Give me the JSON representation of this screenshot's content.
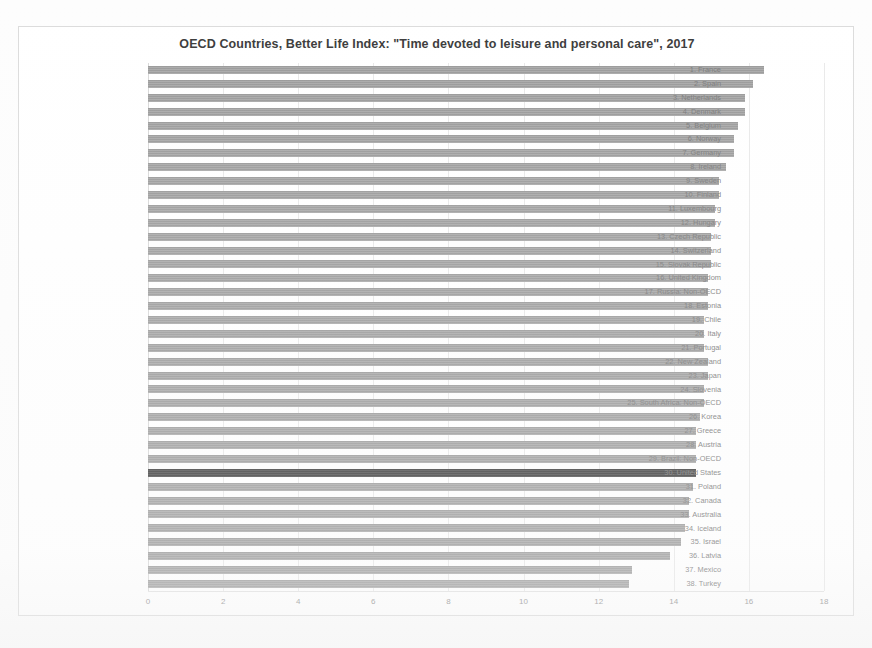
{
  "chart_data": {
    "type": "bar",
    "orientation": "horizontal",
    "title": "OECD Countries, Better Life Index: \"Time devoted to leisure and personal care\", 2017",
    "xlabel": "",
    "ylabel": "",
    "xlim": [
      0,
      18
    ],
    "xticks": [
      0,
      2,
      4,
      6,
      8,
      10,
      12,
      14,
      16,
      18
    ],
    "xtick_labels": [
      "0",
      "2",
      "4",
      "6",
      "8",
      "10",
      "12",
      "14",
      "16",
      "18"
    ],
    "grid": true,
    "grid_axis": "x",
    "legend": false,
    "bar_color": "#9a9a9a",
    "highlight_color": "#3a3a3a",
    "highlight_category": "30. United States",
    "categories": [
      "1. France",
      "2. Spain",
      "3. Netherlands",
      "4. Denmark",
      "5. Belgium",
      "6. Norway",
      "7. Germany",
      "8. Ireland",
      "9. Sweden",
      "10. Finland",
      "11. Luxembourg",
      "12. Hungary",
      "13. Czech Republic",
      "14. Switzerland",
      "15. Slovak Republic",
      "16. United Kingdom",
      "17. Russia: Non-OECD",
      "18. Estonia",
      "19. Chile",
      "20. Italy",
      "21. Portugal",
      "22. New Zealand",
      "23. Japan",
      "24. Slovenia",
      "25. South Africa: Non-OECD",
      "26. Korea",
      "27. Greece",
      "28. Austria",
      "29. Brazil: Non-OECD",
      "30. United States",
      "31. Poland",
      "32. Canada",
      "33. Australia",
      "34. Iceland",
      "35. Israel",
      "36. Latvia",
      "37. Mexico",
      "38. Turkey"
    ],
    "values": [
      16.4,
      16.1,
      15.9,
      15.9,
      15.7,
      15.6,
      15.6,
      15.4,
      15.2,
      15.2,
      15.1,
      15.1,
      15.0,
      15.0,
      15.0,
      14.9,
      14.9,
      14.9,
      14.8,
      14.8,
      14.8,
      14.9,
      14.9,
      14.8,
      14.8,
      14.7,
      14.6,
      14.6,
      14.6,
      14.6,
      14.5,
      14.4,
      14.4,
      14.3,
      14.2,
      13.9,
      12.9,
      12.8
    ],
    "values_unit": "hours per day"
  }
}
